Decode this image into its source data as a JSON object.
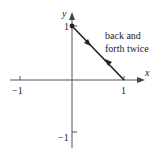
{
  "diagram": {
    "type": "parametric-path-plot",
    "axes": {
      "x_label": "x",
      "y_label": "y",
      "x_ticks": [
        {
          "value": -1,
          "label": "−1"
        },
        {
          "value": 1,
          "label": "1"
        }
      ],
      "y_ticks": [
        {
          "value": 1,
          "label": "1"
        },
        {
          "value": -1,
          "label": "−1"
        }
      ]
    },
    "path": {
      "from": [
        0,
        1
      ],
      "to": [
        1,
        0
      ],
      "start_point_marked": true,
      "direction_arrows": [
        "forward (toward (1,0))",
        "backward (toward (0,1))"
      ]
    },
    "annotation": {
      "line1": "back and",
      "line2": "forth twice"
    },
    "colors": {
      "axis": "#555555",
      "path": "#222222",
      "text": "#222222"
    }
  }
}
